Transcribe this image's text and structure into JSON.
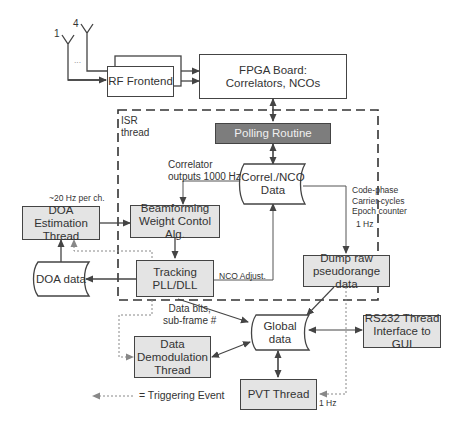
{
  "diagram": {
    "antennas": {
      "first_label": "1",
      "last_label": "4",
      "ellipsis": "..."
    },
    "nodes": {
      "rf_frontend": "RF Frontend",
      "fpga_board": "FPGA Board:\nCorrelators, NCOs",
      "polling_routine": "Polling Routine",
      "correl_nco_data": "Correl./NCO\nData",
      "beamforming": "Beamforming\nWeight Contol Alg.",
      "doa_estimation": "DOA Estimation\nThread",
      "doa_data": "DOA data",
      "tracking": "Tracking\nPLL/DLL",
      "dump_raw": "Dump raw\npseudorange data",
      "global_data": "Global\ndata",
      "rs232": "RS232 Thread\nInterface to GUI",
      "data_demod": "Data\nDemodulation\nThread",
      "pvt_thread": "PVT Thread"
    },
    "labels": {
      "isr_thread": "ISR\nthread",
      "correlator_outputs": "Correlator\noutputs 1000 Hz",
      "doa_rate": "~20 Hz per ch.",
      "code_phase": "Code-phase\nCarrier-cycles\nEpoch counter",
      "one_hz_dump": "1 Hz",
      "nco_adjust": "NCO Adjust.",
      "data_bits": "Data bits,\nsub-frame #",
      "one_hz_pvt": "1 Hz",
      "legend_triggering": "= Triggering Event"
    },
    "colors": {
      "line": "#444444",
      "box_fill_grey": "#e4e4e4",
      "polling_fill": "#7d7d7d",
      "trigger_line": "#888888"
    }
  }
}
